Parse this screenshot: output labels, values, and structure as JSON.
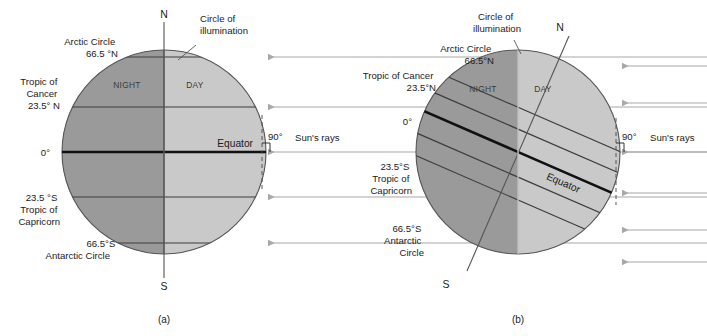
{
  "figure": {
    "background_color": "#ffffff",
    "night_color": "#9a9a9a",
    "day_color": "#c9c9c9",
    "outline_color": "#4a4a4a",
    "ray_color": "#a8a8a8",
    "text_color": "#1b1b1b"
  },
  "panels": [
    {
      "id": "a",
      "caption": "(a)",
      "geometry": {
        "cx": 164,
        "cy": 152,
        "r": 102,
        "axis_tilt_deg": 0,
        "terminator_tilt_deg": 0
      },
      "pole_north": "N",
      "pole_south": "S",
      "terminator_label": "Circle of illumination",
      "night_label": "NIGHT",
      "day_label": "DAY",
      "equator_label": "Equator",
      "angle_label": "90°",
      "rays_label": "Sun's rays",
      "ray_count": 5,
      "latitudes": [
        {
          "name": "arctic-circle",
          "lines": [
            "Arctic Circle",
            "66.5 °N"
          ],
          "deg": 66.5
        },
        {
          "name": "tropic-of-cancer",
          "lines": [
            "Tropic of",
            "Cancer",
            "23.5° N"
          ],
          "deg": 23.5
        },
        {
          "name": "equator",
          "lines": [
            "0°"
          ],
          "deg": 0
        },
        {
          "name": "tropic-of-capricorn",
          "lines": [
            "23.5 °S",
            "Tropic of",
            "Capricorn"
          ],
          "deg": -23.5
        },
        {
          "name": "antarctic-circle",
          "lines": [
            "66.5°S",
            "Antarctic Circle"
          ],
          "deg": -66.5
        }
      ]
    },
    {
      "id": "b",
      "caption": "(b)",
      "geometry": {
        "cx": 518,
        "cy": 152,
        "r": 102,
        "axis_tilt_deg": 23.5,
        "terminator_tilt_deg": 0
      },
      "pole_north": "N",
      "pole_south": "S",
      "terminator_label": "Circle of illumination",
      "night_label": "NIGHT",
      "day_label": "DAY",
      "equator_label": "Equator",
      "angle_label": "90°",
      "rays_label": "Sun's rays",
      "ray_count": 6,
      "latitudes": [
        {
          "name": "arctic-circle",
          "lines": [
            "Arctic Circle",
            "66.5°N"
          ],
          "deg": 66.5
        },
        {
          "name": "tropic-of-cancer",
          "lines": [
            "Tropic of Cancer",
            "23.5°N"
          ],
          "deg": 23.5
        },
        {
          "name": "equator",
          "lines": [
            "0°"
          ],
          "deg": 0
        },
        {
          "name": "tropic-of-capricorn",
          "lines": [
            "23.5°S",
            "Tropic of",
            "Capricorn"
          ],
          "deg": -23.5
        },
        {
          "name": "antarctic-circle",
          "lines": [
            "66.5°S",
            "Antarctic",
            "Circle"
          ],
          "deg": -66.5
        }
      ]
    }
  ]
}
